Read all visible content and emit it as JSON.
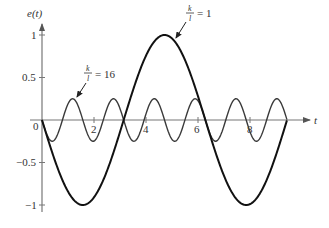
{
  "chart_data": {
    "type": "line",
    "title": "",
    "xlabel": "t",
    "ylabel": "e(t)",
    "xlim": [
      0,
      9.42
    ],
    "ylim": [
      -1,
      1
    ],
    "x_ticks": [
      2,
      4,
      6,
      8
    ],
    "x_tick_labels": [
      "2",
      "4",
      "6",
      "8"
    ],
    "y_ticks": [
      1,
      0.5,
      -0.5,
      -1
    ],
    "y_tick_labels": [
      "1",
      "0.5",
      "−0.5",
      "−1"
    ],
    "origin_label": "0",
    "grid": false,
    "legend": "inline annotations with arrows",
    "series": [
      {
        "name": "k/l = 1",
        "formula": "e(t) = -sin(t)",
        "amplitude": 1,
        "angular_frequency": 1,
        "x": [
          0,
          1.57,
          3.14,
          4.71,
          6.28,
          7.85,
          9.42
        ],
        "values": [
          0,
          -1,
          0,
          1,
          0,
          -1,
          0
        ],
        "stroke_width": 2,
        "color": "#111111"
      },
      {
        "name": "k/l = 16",
        "formula": "e(t) = -0.25 sin(4t)",
        "amplitude": 0.25,
        "angular_frequency": 4,
        "x": [
          0,
          0.39,
          0.79,
          1.18,
          1.57,
          1.96,
          2.36,
          2.75,
          3.14
        ],
        "values": [
          0,
          -0.25,
          0,
          0.25,
          0,
          -0.25,
          0,
          0.25,
          0
        ],
        "stroke_width": 1.4,
        "color": "#333333"
      }
    ],
    "annotations": [
      {
        "text_num": "k",
        "text_den": "l",
        "text_rest": "= 1",
        "target_series": "k/l = 1"
      },
      {
        "text_num": "k",
        "text_den": "l",
        "text_rest": "= 16",
        "target_series": "k/l = 16"
      }
    ]
  },
  "labels": {
    "y_axis": "e(t)",
    "x_axis": "t",
    "origin": "0",
    "ann1_num": "k",
    "ann1_den": "l",
    "ann1_rest": "= 1",
    "ann2_num": "k",
    "ann2_den": "l",
    "ann2_rest": "= 16",
    "xt2": "2",
    "xt4": "4",
    "xt6": "6",
    "xt8": "8",
    "yt1": "1",
    "yt05": "0.5",
    "ytm05": "−0.5",
    "ytm1": "−1"
  }
}
